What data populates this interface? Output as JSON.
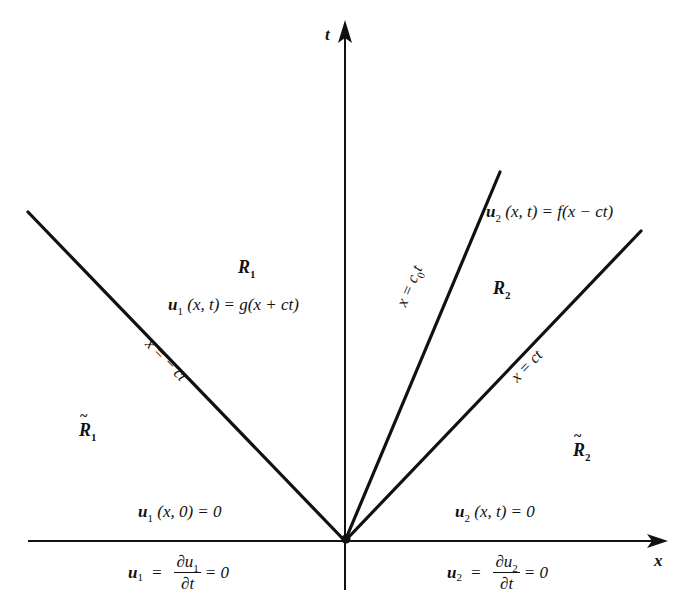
{
  "diagram": {
    "axes": {
      "horizontal_label": "x",
      "vertical_label": "t",
      "origin": [
        345,
        541
      ]
    },
    "lines": [
      {
        "id": "characteristic-left",
        "equation_lhs": "x",
        "equation_rhs": "− ct",
        "from": [
          28,
          212
        ],
        "to": [
          345,
          541
        ]
      },
      {
        "id": "interface",
        "equation_lhs": "x",
        "equation_rhs_base": "c",
        "equation_rhs_sub": "0",
        "equation_rhs_tail": "t",
        "from": [
          345,
          541
        ],
        "to": [
          500,
          172
        ]
      },
      {
        "id": "characteristic-right",
        "equation_lhs": "x",
        "equation_rhs": "ct",
        "from": [
          345,
          541
        ],
        "to": [
          641,
          231
        ]
      }
    ],
    "regions": {
      "R1": {
        "base": "R",
        "sub": "1"
      },
      "R2": {
        "base": "R",
        "sub": "2"
      },
      "R1_tilde": {
        "tilde": "~",
        "base": "R",
        "sub": "1"
      },
      "R2_tilde": {
        "tilde": "~",
        "base": "R",
        "sub": "2"
      }
    },
    "equations": {
      "u1_solution": {
        "u": "u",
        "sub": "1",
        "args": "(x, t) = g(x + ct)"
      },
      "u2_solution": {
        "u": "u",
        "sub": "2",
        "args": "(x, t) = f(x − ct)"
      },
      "u1_initial": {
        "u": "u",
        "sub": "1",
        "args": "(x, 0) = 0"
      },
      "u2_zero": {
        "u": "u",
        "sub": "2",
        "args": "(x, t) = 0"
      },
      "u1_bc": {
        "u": "u",
        "sub": "1",
        "eq": "=",
        "num": "∂u",
        "num_sub": "1",
        "den": "∂t",
        "tail": "= 0"
      },
      "u2_bc": {
        "u": "u",
        "sub": "2",
        "eq": "=",
        "num": "∂u",
        "num_sub": "2",
        "den": "∂t",
        "tail": "= 0"
      }
    }
  }
}
